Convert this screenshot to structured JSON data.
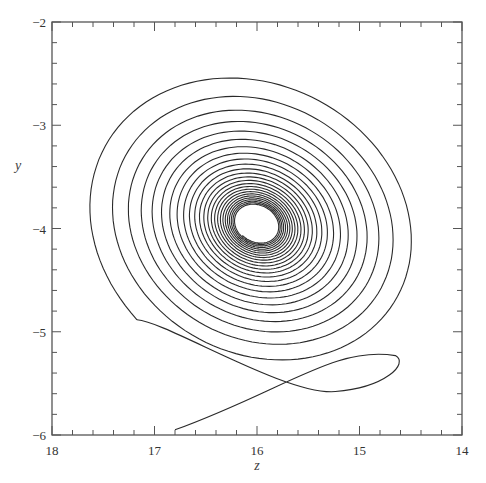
{
  "chart_data": {
    "type": "line",
    "title": "",
    "xlabel": "z",
    "ylabel": "y",
    "xlim": [
      18,
      14
    ],
    "ylim": [
      -6,
      -2
    ],
    "x_reversed": true,
    "x_ticks": [
      18,
      17,
      16,
      15,
      14
    ],
    "x_tick_labels": [
      "18",
      "17",
      "16",
      "15",
      "14"
    ],
    "y_ticks": [
      -2,
      -3,
      -4,
      -5,
      -6
    ],
    "y_tick_labels": [
      "−2",
      "−3",
      "−4",
      "−5",
      "−6"
    ],
    "minor_tick_step": 0.2,
    "grid": false,
    "legend": null,
    "series": [
      {
        "name": "trajectory (z, y)",
        "description": "Inward-converging elliptical spiral (phase-plane trajectory) starting near z=16.8, y=-5.95, looping through a hairpin near z=14.65, y=-5.25, then spiralling ~25 turns toward a limit cycle centred at about z=16.0, y=-4.05",
        "start_point": [
          16.8,
          -5.95
        ],
        "hairpin_point": [
          14.65,
          -5.25
        ],
        "crossing_point": [
          15.85,
          -5.6
        ],
        "outer_extent": {
          "z_max": 17.75,
          "z_min": 14.25,
          "y_max": -2.6,
          "y_min": -5.6
        },
        "limit_cycle_center": [
          16.0,
          -4.05
        ],
        "limit_cycle_radii": {
          "z": 0.22,
          "y": 0.18
        },
        "turns": 25
      }
    ]
  },
  "plot": {
    "frame": {
      "left": 52,
      "top": 22,
      "right": 462,
      "bottom": 435
    },
    "line_color": "#2a2a2a",
    "axis_color": "#555555",
    "spiral": {
      "center_px": [
        257,
        224
      ],
      "outer_rx": 178,
      "outer_ry": 150,
      "inner_rx": 22,
      "inner_ry": 18,
      "tilt_deg": 28,
      "turns": 25
    }
  }
}
